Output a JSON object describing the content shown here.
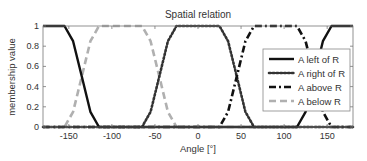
{
  "chart_data": {
    "type": "line",
    "title": "Spatial relation",
    "xlabel": "Angle [°]",
    "ylabel": "membership value",
    "xlim": [
      -180,
      180
    ],
    "ylim": [
      0,
      1
    ],
    "xticks": [
      -150,
      -100,
      -50,
      0,
      50,
      100,
      150
    ],
    "yticks": [
      0,
      0.2,
      0.4,
      0.6,
      0.8,
      1
    ],
    "grid": false,
    "legend_position": "right-inside",
    "series": [
      {
        "name": "A left of R",
        "style": "solid",
        "color": "#111111",
        "x": [
          -180,
          -155,
          -145,
          -135,
          -125,
          -115,
          115,
          125,
          135,
          145,
          155,
          180
        ],
        "y": [
          1,
          1,
          0.85,
          0.5,
          0.15,
          0,
          0,
          0.15,
          0.5,
          0.85,
          1,
          1
        ]
      },
      {
        "name": "A right of R",
        "style": "dotted",
        "color": "#333333",
        "x": [
          -180,
          -65,
          -55,
          -45,
          -35,
          -25,
          25,
          35,
          45,
          55,
          65,
          180
        ],
        "y": [
          0,
          0,
          0.15,
          0.5,
          0.85,
          1,
          1,
          0.85,
          0.5,
          0.15,
          0,
          0
        ]
      },
      {
        "name": "A above R",
        "style": "dashdot",
        "color": "#111111",
        "x": [
          -180,
          25,
          35,
          45,
          55,
          65,
          115,
          125,
          135,
          145,
          155,
          180
        ],
        "y": [
          0,
          0,
          0.15,
          0.5,
          0.85,
          1,
          1,
          0.85,
          0.5,
          0.15,
          0,
          0
        ]
      },
      {
        "name": "A below R",
        "style": "dashed",
        "color": "#b0b0b0",
        "x": [
          -180,
          -155,
          -145,
          -135,
          -125,
          -115,
          -65,
          -55,
          -45,
          -35,
          -25,
          180
        ],
        "y": [
          0,
          0,
          0.15,
          0.5,
          0.85,
          1,
          1,
          0.85,
          0.5,
          0.15,
          0,
          0
        ]
      }
    ]
  },
  "labels": {
    "title": "Spatial relation",
    "xlabel": "Angle [°]",
    "ylabel": "membership value",
    "legend": [
      "A left of R",
      "A right of R",
      "A above R",
      "A below R"
    ]
  }
}
